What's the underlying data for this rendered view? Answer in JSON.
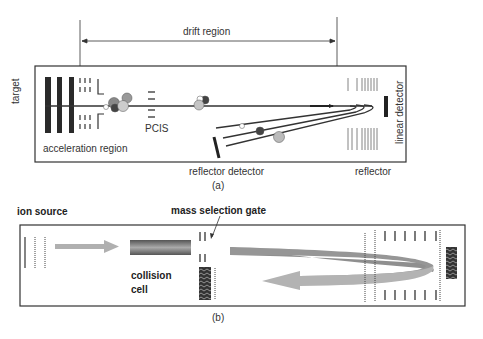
{
  "panel_a": {
    "caption": "(a)",
    "labels": {
      "drift_region": "drift region",
      "target": "target",
      "pcis": "PCIS",
      "acceleration_region": "acceleration region",
      "reflector_detector": "reflector detector",
      "reflector": "reflector",
      "linear_detector": "linear detector"
    }
  },
  "panel_b": {
    "caption": "(b)",
    "labels": {
      "ion_source": "ion source",
      "mass_selection_gate": "mass selection gate",
      "collision_cell_line1": "collision",
      "collision_cell_line2": "cell"
    }
  },
  "colors": {
    "line": "#333333",
    "beam_arrow": "#999999",
    "beam_arrow_light": "#b5b5b5",
    "ion_dark": "#555555",
    "ion_mid": "#8a8a8a",
    "ion_light": "#c4c4c4"
  }
}
